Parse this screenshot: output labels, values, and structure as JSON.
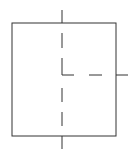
{
  "diagram": {
    "stroke_color": "#333333",
    "background": "#ffffff",
    "rect": {
      "x": 12,
      "y": 23,
      "width": 104,
      "height": 113
    },
    "center": {
      "x": 62,
      "y": 75
    },
    "stubs": [
      {
        "side": "top",
        "x1": 62,
        "y1": 10,
        "x2": 62,
        "y2": 23
      },
      {
        "side": "bottom",
        "x1": 62,
        "y1": 136,
        "x2": 62,
        "y2": 149
      },
      {
        "side": "right",
        "x1": 116,
        "y1": 75,
        "x2": 128,
        "y2": 75
      }
    ],
    "dashed_lines": [
      {
        "name": "vertical-upper",
        "x1": 62,
        "y1": 33,
        "x2": 62,
        "y2": 75
      },
      {
        "name": "vertical-lower",
        "x1": 62,
        "y1": 88,
        "x2": 62,
        "y2": 126
      },
      {
        "name": "horizontal-right",
        "x1": 62,
        "y1": 75,
        "x2": 102,
        "y2": 75
      }
    ]
  }
}
